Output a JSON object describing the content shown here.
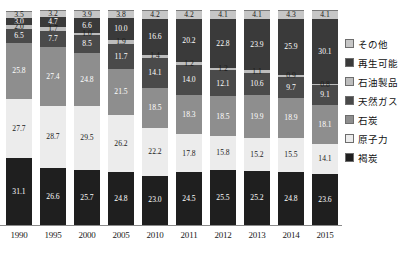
{
  "chart_data": {
    "type": "bar",
    "stacked": true,
    "title": "",
    "xlabel": "",
    "ylabel": "",
    "ylim": [
      0,
      100
    ],
    "grid": false,
    "legend_position": "right",
    "categories": [
      "1990",
      "1995",
      "2000",
      "2005",
      "2010",
      "2011",
      "2012",
      "2013",
      "2014",
      "2015"
    ],
    "series": [
      {
        "name": "その他",
        "color": "#c6c6c6",
        "label_color": "#1a1a1a",
        "values": [
          3.5,
          3.2,
          3.9,
          3.8,
          4.2,
          4.2,
          4.1,
          4.1,
          4.3,
          4.1
        ]
      },
      {
        "name": "再生可能",
        "color": "#3a3a3a",
        "label_color": "#ffffff",
        "values": [
          3.0,
          4.7,
          6.6,
          10.0,
          16.6,
          20.2,
          22.8,
          23.9,
          25.9,
          30.1
        ]
      },
      {
        "name": "石油製品",
        "color": "#bdbdbd",
        "label_color": "#1a1a1a",
        "values": [
          2.0,
          1.7,
          1.0,
          1.9,
          1.4,
          1.2,
          1.2,
          1.1,
          0.9,
          0.8
        ]
      },
      {
        "name": "天然ガス",
        "color": "#4a4a4a",
        "label_color": "#ffffff",
        "values": [
          6.5,
          7.7,
          8.5,
          11.7,
          14.1,
          14.0,
          12.1,
          10.6,
          9.7,
          9.1
        ]
      },
      {
        "name": "石炭",
        "color": "#8e8e8e",
        "label_color": "#ffffff",
        "values": [
          25.8,
          27.4,
          24.8,
          21.5,
          18.5,
          18.3,
          18.5,
          19.9,
          18.9,
          18.1
        ]
      },
      {
        "name": "原子力",
        "color": "#ececec",
        "label_color": "#1a1a1a",
        "values": [
          27.7,
          28.7,
          29.5,
          26.2,
          22.2,
          17.8,
          15.8,
          15.2,
          15.5,
          14.1
        ]
      },
      {
        "name": "褐炭",
        "color": "#1f1f1f",
        "label_color": "#ffffff",
        "values": [
          31.1,
          26.6,
          25.7,
          24.8,
          23.0,
          24.5,
          25.5,
          25.2,
          24.8,
          23.6
        ]
      }
    ]
  },
  "legend": {
    "items": [
      {
        "label": "その他",
        "color": "#c6c6c6"
      },
      {
        "label": "再生可能",
        "color": "#3a3a3a"
      },
      {
        "label": "石油製品",
        "color": "#bdbdbd"
      },
      {
        "label": "天然ガス",
        "color": "#4a4a4a"
      },
      {
        "label": "石炭",
        "color": "#8e8e8e"
      },
      {
        "label": "原子力",
        "color": "#ececec"
      },
      {
        "label": "褐炭",
        "color": "#1f1f1f"
      }
    ]
  }
}
